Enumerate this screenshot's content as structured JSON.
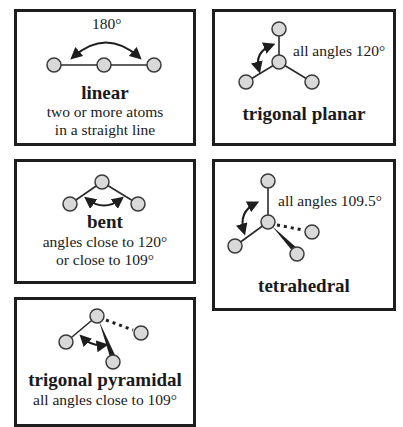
{
  "colors": {
    "border": "#1e1e1e",
    "atom_fill": "#d9d9d9",
    "atom_stroke": "#3a3a3a",
    "bond": "#2a2a2a",
    "text": "#1a1a1a",
    "background": "#ffffff"
  },
  "panels": {
    "linear": {
      "angle_label": "180°",
      "name": "linear",
      "description_line1": "two or more atoms",
      "description_line2": "in a straight line"
    },
    "trigonal_planar": {
      "angle_label": "all angles 120°",
      "name": "trigonal planar"
    },
    "bent": {
      "name": "bent",
      "description_line1": "angles close to 120°",
      "description_line2": "or close to 109°"
    },
    "tetrahedral": {
      "angle_label": "all angles 109.5°",
      "name": "tetrahedral"
    },
    "trigonal_pyramidal": {
      "name": "trigonal pyramidal",
      "description_line1": "all angles close to 109°"
    }
  }
}
